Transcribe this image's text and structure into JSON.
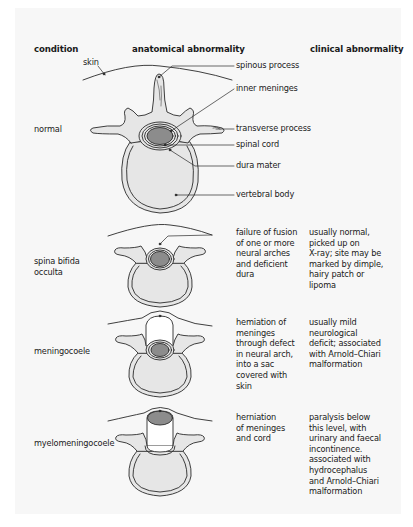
{
  "headers": {
    "condition": "condition",
    "anatomical": "anatomical abnormality",
    "clinical": "clinical abnormality"
  },
  "normal": {
    "condition": "normal",
    "labels": {
      "skin": "skin",
      "spinous_process": "spinous process",
      "inner_meninges": "inner meninges",
      "transverse_process": "transverse process",
      "spinal_cord": "spinal cord",
      "dura_mater": "dura mater",
      "vertebral_body": "vertebral body"
    }
  },
  "rows": [
    {
      "condition": "spina bifida\nocculta",
      "anatomical": "failure of fusion\nof one or more\nneural arches\nand deficient\ndura",
      "clinical": "usually normal,\npicked up on\nX-ray; site may be\nmarked by dimple,\nhairy patch or\nlipoma"
    },
    {
      "condition": "meningocoele",
      "anatomical": "hemiation of\nmeninges\nthrough defect\nin neural arch,\ninto a sac\ncovered with\nskin",
      "clinical": "usually mild\nneurological\ndeficit; associated\nwith Arnold–Chiari\nmalformation"
    },
    {
      "condition": "myelomeningocoele",
      "anatomical": "herniation\nof meninges\nand cord",
      "clinical": "paralysis below\nthis level, with\nurinary and faecal\nincontinence.\nassociated with\nhydrocephalus\nand Arnold–Chiari\nmalformation"
    }
  ],
  "colors": {
    "bone_fill": "#e6e6e6",
    "cord_fill": "#8c8c8c",
    "outline": "#2a2a2a",
    "panel": "#f7f7f7"
  }
}
